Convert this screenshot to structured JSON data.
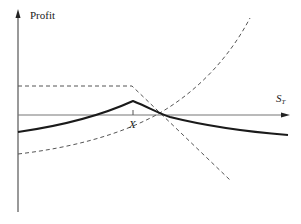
{
  "diagram": {
    "type": "option-strategy-payoff",
    "axes": {
      "y_label": "Profit",
      "x_label_base": "S",
      "x_label_sub": "T",
      "strike_label": "X"
    },
    "colors": {
      "axis": "#555555",
      "solid_curve": "#1a1a1a",
      "dashed": "#555555",
      "text": "#222222"
    },
    "series": [
      {
        "name": "net-position",
        "style": "solid",
        "description": "Overall profit: rises to a peak at X then falls"
      },
      {
        "name": "short-position-dashed",
        "style": "dashed",
        "description": "Flat to X, then declines linearly"
      },
      {
        "name": "convex-position-dashed",
        "style": "dashed",
        "description": "Convex increasing curve"
      }
    ]
  }
}
